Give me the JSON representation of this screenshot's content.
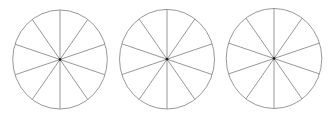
{
  "diagram": {
    "stroke_color": "#8c8c8c",
    "center_dot_color": "#222222",
    "background": "#ffffff",
    "circles": [
      {
        "id": "circle-1",
        "cx": 60,
        "cy": 59.5,
        "rx": 47.3,
        "ry": 49.5,
        "sectors": 10
      },
      {
        "id": "circle-2",
        "cx": 167,
        "cy": 59.2,
        "rx": 47.5,
        "ry": 49.8,
        "sectors": 10
      },
      {
        "id": "circle-3",
        "cx": 274,
        "cy": 58.5,
        "rx": 47.8,
        "ry": 50,
        "sectors": 10
      }
    ]
  }
}
